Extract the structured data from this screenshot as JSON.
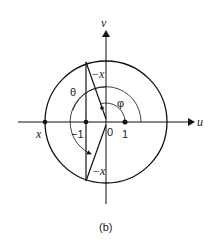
{
  "diagram": {
    "axes": {
      "horizontal_label": "u",
      "vertical_label": "v"
    },
    "points": {
      "x_label": "x",
      "neg_one_label": "−1",
      "origin_label": "0",
      "one_label": "1"
    },
    "segment_labels": {
      "upper": "−x",
      "lower": "−x"
    },
    "angles": {
      "theta": "θ",
      "phi": "φ"
    },
    "caption": "(b)"
  }
}
